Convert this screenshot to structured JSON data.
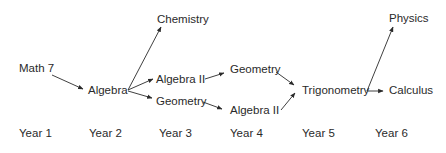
{
  "diagram": {
    "type": "course-progression-flowchart",
    "nodes": [
      {
        "id": "math7",
        "label": "Math 7",
        "year": 1
      },
      {
        "id": "algebra",
        "label": "Algebra",
        "year": 2
      },
      {
        "id": "chemistry",
        "label": "Chemistry",
        "year": 3
      },
      {
        "id": "algebra2_y3",
        "label": "Algebra II",
        "year": 3
      },
      {
        "id": "geometry_y3",
        "label": "Geometry",
        "year": 3
      },
      {
        "id": "geometry_y4",
        "label": "Geometry",
        "year": 4
      },
      {
        "id": "algebra2_y4",
        "label": "Algebra II",
        "year": 4
      },
      {
        "id": "trigonometry",
        "label": "Trigonometry",
        "year": 5
      },
      {
        "id": "physics",
        "label": "Physics",
        "year": 6
      },
      {
        "id": "calculus",
        "label": "Calculus",
        "year": 6
      }
    ],
    "edges": [
      [
        "math7",
        "algebra"
      ],
      [
        "algebra",
        "chemistry"
      ],
      [
        "algebra",
        "algebra2_y3"
      ],
      [
        "algebra",
        "geometry_y3"
      ],
      [
        "algebra2_y3",
        "geometry_y4"
      ],
      [
        "geometry_y3",
        "algebra2_y4"
      ],
      [
        "geometry_y4",
        "trigonometry"
      ],
      [
        "algebra2_y4",
        "trigonometry"
      ],
      [
        "trigonometry",
        "physics"
      ],
      [
        "trigonometry",
        "calculus"
      ]
    ],
    "years": [
      "Year 1",
      "Year 2",
      "Year 3",
      "Year 4",
      "Year 5",
      "Year 6"
    ]
  }
}
